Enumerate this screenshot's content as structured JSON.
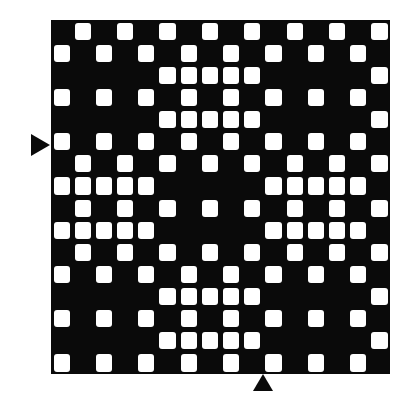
{
  "pattern": {
    "title": "",
    "rows": 16,
    "cols": 16,
    "colors": {
      "background": "#0a0a0a",
      "cell": "#ffffff",
      "marker": "#0a0a0a"
    },
    "white_cells_by_row": [
      [
        1,
        3,
        5,
        7,
        9,
        11,
        13,
        15
      ],
      [
        0,
        2,
        4,
        6,
        8,
        10,
        12,
        14
      ],
      [
        5,
        6,
        7,
        8,
        9,
        15
      ],
      [
        0,
        2,
        4,
        6,
        8,
        10,
        12,
        14
      ],
      [
        5,
        6,
        7,
        8,
        9,
        15
      ],
      [
        0,
        2,
        4,
        6,
        8,
        10,
        12,
        14
      ],
      [
        1,
        3,
        5,
        7,
        9,
        11,
        13,
        15
      ],
      [
        0,
        1,
        2,
        3,
        4,
        10,
        11,
        12,
        13,
        14
      ],
      [
        1,
        3,
        5,
        7,
        9,
        11,
        13,
        15
      ],
      [
        0,
        1,
        2,
        3,
        4,
        10,
        11,
        12,
        13,
        14
      ],
      [
        1,
        3,
        5,
        7,
        9,
        11,
        13,
        15
      ],
      [
        0,
        2,
        4,
        6,
        8,
        10,
        12,
        14
      ],
      [
        5,
        6,
        7,
        8,
        9,
        15
      ],
      [
        0,
        2,
        4,
        6,
        8,
        10,
        12,
        14
      ],
      [
        5,
        6,
        7,
        8,
        9,
        15
      ],
      [
        0,
        2,
        4,
        6,
        8,
        10,
        12,
        14
      ]
    ],
    "markers": [
      {
        "name": "left-marker",
        "direction": "right",
        "between_rows": [
          5,
          6
        ]
      },
      {
        "name": "bottom-marker",
        "direction": "up",
        "between_cols": [
          9,
          10
        ]
      }
    ]
  }
}
